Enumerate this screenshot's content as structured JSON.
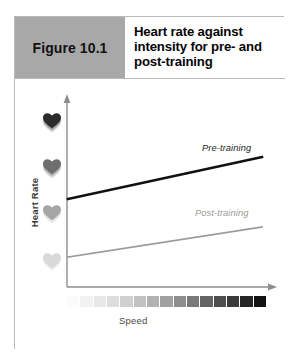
{
  "figure": {
    "number_label": "Figure 10.1",
    "title": "Heart rate against intensity for pre- and post-training",
    "number_box_color": "#a8a8a8",
    "border_color": "#b9b9b9"
  },
  "chart_data": {
    "type": "line",
    "title": "Heart rate against intensity for pre- and post-training",
    "xlabel": "Speed",
    "ylabel": "Heart Rate",
    "grid": false,
    "legend_position": "inline-right",
    "axis_style": "arrow-headed, unlabeled ticks",
    "xlim": [
      0,
      10
    ],
    "ylim": [
      0,
      10
    ],
    "x": [
      0,
      10
    ],
    "series": [
      {
        "name": "Pre-training",
        "label": "Pre-training",
        "color": "#111111",
        "width": 2.6,
        "values": [
          4.15,
          7.05
        ],
        "start_point": [
          0,
          4.15
        ],
        "end_point": [
          10,
          7.05
        ]
      },
      {
        "name": "Post-training",
        "label": "Post-training",
        "color": "#9a9a9a",
        "width": 1.6,
        "values": [
          1.95,
          4.05
        ],
        "start_point": [
          0,
          1.95
        ],
        "end_point": [
          10,
          4.05
        ]
      }
    ],
    "y_axis_markers": {
      "name": "heart-rate-intensity-icons",
      "description": "Four stacked heart glyphs increasing in darkness with heart rate",
      "items": [
        {
          "position": "top",
          "color": "#2b2b2b",
          "intensity": "highest"
        },
        {
          "position": "upper-middle",
          "color": "#6e6e6e",
          "intensity": "high"
        },
        {
          "position": "lower-middle",
          "color": "#a5a5a5",
          "intensity": "medium"
        },
        {
          "position": "bottom",
          "color": "#d8d8d8",
          "intensity": "low"
        }
      ]
    },
    "x_axis_gradient": {
      "name": "speed-intensity-gradient",
      "description": "Discrete swatch ramp from light to dark indicating increasing speed",
      "segment_count": 15,
      "colors": [
        "#fbfbfb",
        "#f2f2f2",
        "#e8e8e8",
        "#dddddd",
        "#d0d0d0",
        "#c2c2c2",
        "#b2b2b2",
        "#a0a0a0",
        "#8d8d8d",
        "#797979",
        "#646464",
        "#4e4e4e",
        "#3a3a3a",
        "#262626",
        "#121212"
      ]
    }
  }
}
